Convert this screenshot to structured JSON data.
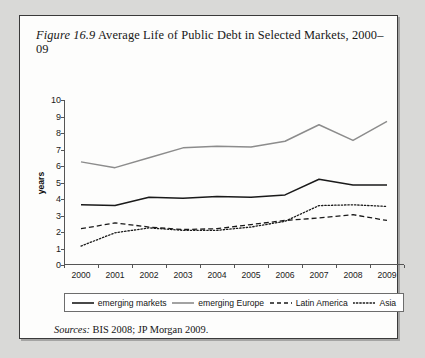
{
  "figure": {
    "number_label": "Figure 16.9",
    "title": "Average Life of Public Debt in Selected Markets, 2000–09",
    "sources_label": "Sources:",
    "sources_text": "BIS 2008; JP Morgan 2009."
  },
  "colors": {
    "emerging_markets": "#1a1a1a",
    "emerging_europe": "#8c8c8c",
    "latin_america": "#1a1a1a",
    "asia": "#1a1a1a",
    "axis": "#555555",
    "card_background": "#fdfdfc",
    "page_background": "#d9d9d7"
  },
  "legend": {
    "items": [
      {
        "label": "emerging markets",
        "style": "solid",
        "color": "#1a1a1a"
      },
      {
        "label": "emerging Europe",
        "style": "solid",
        "color": "#8c8c8c"
      },
      {
        "label": "Latin America",
        "style": "dashed",
        "color": "#1a1a1a"
      },
      {
        "label": "Asia",
        "style": "dotted",
        "color": "#1a1a1a"
      }
    ]
  },
  "chart_data": {
    "type": "line",
    "title": "Average Life of Public Debt in Selected Markets, 2000–09",
    "xlabel": "",
    "ylabel": "years",
    "categories": [
      "2000",
      "2001",
      "2002",
      "2003",
      "2004",
      "2005",
      "2006",
      "2007",
      "2008",
      "2009"
    ],
    "ylim": [
      0,
      10
    ],
    "ytick_labels": [
      "0",
      "1",
      "2",
      "3",
      "4",
      "5",
      "6",
      "7",
      "8",
      "9",
      "10"
    ],
    "grid": false,
    "legend_position": "bottom",
    "series": [
      {
        "name": "emerging markets",
        "style": "solid",
        "color": "#1a1a1a",
        "values": [
          3.65,
          3.6,
          4.1,
          4.05,
          4.15,
          4.1,
          4.25,
          5.2,
          4.85,
          4.85
        ]
      },
      {
        "name": "emerging Europe",
        "style": "solid",
        "color": "#8c8c8c",
        "values": [
          6.25,
          5.9,
          6.5,
          7.1,
          7.2,
          7.15,
          7.5,
          8.5,
          7.55,
          8.7
        ]
      },
      {
        "name": "Latin America",
        "style": "dashed",
        "color": "#1a1a1a",
        "values": [
          2.2,
          2.55,
          2.3,
          2.15,
          2.2,
          2.45,
          2.7,
          2.85,
          3.05,
          2.7
        ]
      },
      {
        "name": "Asia",
        "style": "dotted",
        "color": "#1a1a1a",
        "values": [
          1.15,
          1.95,
          2.25,
          2.1,
          2.1,
          2.3,
          2.65,
          3.6,
          3.65,
          3.55
        ]
      }
    ]
  }
}
